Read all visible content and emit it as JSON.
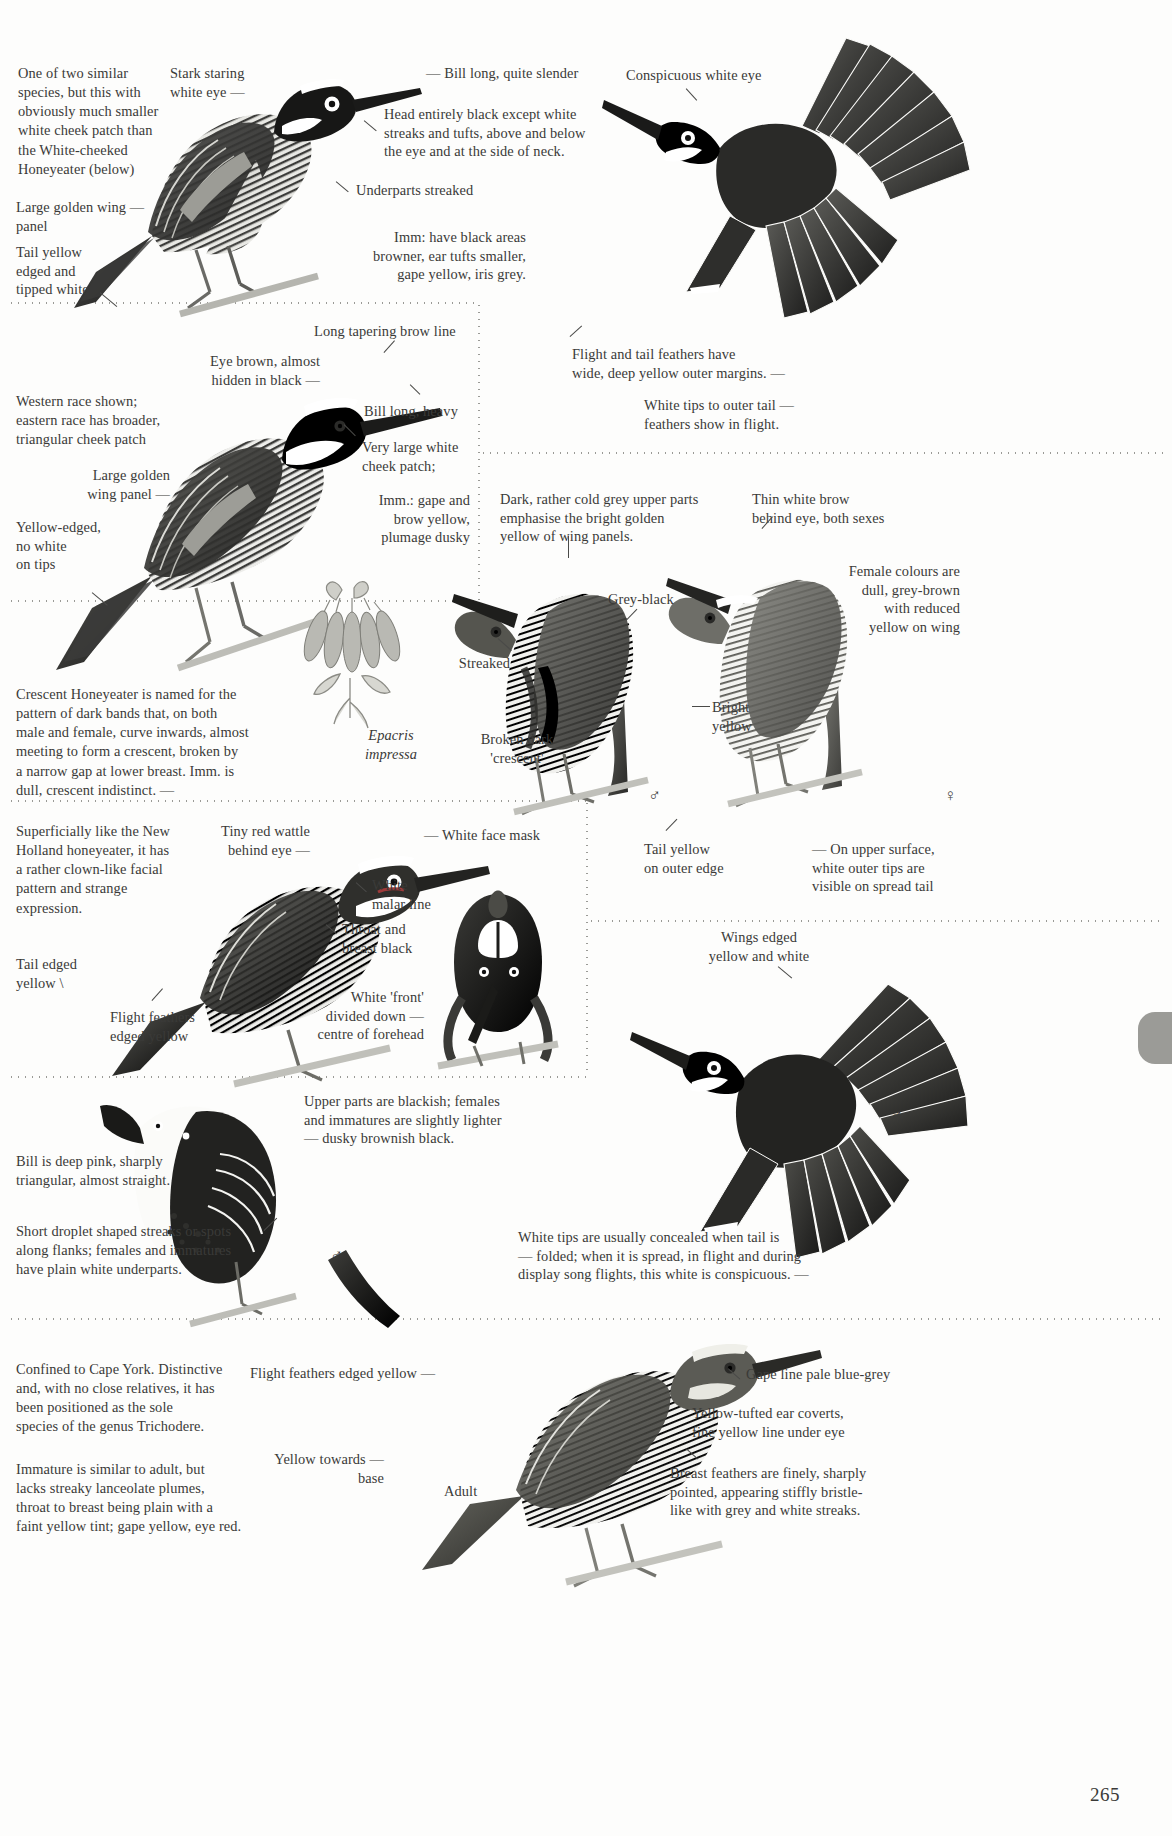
{
  "page": {
    "number": "265"
  },
  "panels": {
    "p1": {
      "intro": "One of two similar\nspecies, but this with\nobviously much smaller\nwhite cheek patch than\nthe White-cheeked\nHoneyeater (below)",
      "labels": {
        "stark_eye": "Stark staring\nwhite eye  —",
        "golden_panel": "Large golden wing  —\npanel",
        "tail": "Tail yellow\nedged and\ntipped white",
        "bill": "—  Bill long, quite slender",
        "head": "Head entirely black except white\nstreaks and tufts, above and below\nthe eye and at the side of neck.",
        "underparts": "Underparts streaked",
        "imm": "Imm: have black areas\nbrowner, ear tufts smaller,\ngape yellow, iris grey.",
        "white_eye": "Conspicuous white eye",
        "flight_feathers": "Flight and tail feathers have\nwide, deep yellow outer margins.  —",
        "white_tips": "White tips to outer tail  —\nfeathers show in flight."
      }
    },
    "p2": {
      "labels": {
        "brow": "Long tapering brow line",
        "eye_brown": "Eye brown, almost\nhidden in black  —",
        "race": "Western race shown;\neastern race has broader,\ntriangular cheek patch",
        "golden_panel": "Large golden\nwing panel  —",
        "yellow_edged": "Yellow-edged,\nno white\non tips",
        "bill": "Bill long, heavy",
        "cheek": "Very large white\ncheek patch;",
        "imm": "Imm.: gape and\nbrow yellow,\nplumage dusky"
      }
    },
    "p3": {
      "crescent_text": "Crescent Honeyeater is named for the\npattern of dark bands that, on both\nmale and female, curve inwards, almost\nmeeting to form a crescent, broken by\na narrow gap at lower breast.  Imm. is\ndull, crescent indistinct.      —",
      "plant": "Epacris\nimpressa",
      "labels": {
        "dark_grey": "Dark, rather cold grey upper parts\nemphasise the bright golden\nyellow of wing panels.",
        "streaked": "Streaked",
        "grey_black": "Grey-black",
        "broken": "Broken dark\n'crescent'",
        "thin_brow": "Thin white brow\nbehind eye, both sexes",
        "female": "Female colours are\ndull, grey-brown\nwith reduced\nyellow on wing",
        "bright_yellow": "Bright\nyellow",
        "tail_yellow": "Tail yellow\non outer edge",
        "upper_surface": "—  On upper surface,\nwhite outer tips are\nvisible on spread tail",
        "male_symbol": "♂",
        "female_symbol": "♀"
      }
    },
    "p4": {
      "intro": "Superficially like the New\nHolland honeyeater, it has\na rather clown-like facial\npattern and strange\nexpression.",
      "labels": {
        "wattle": "Tiny red wattle\nbehind eye  —",
        "face_mask": "—  White face mask",
        "malar": "White\nmalar line",
        "throat": "Throat and\nbreast black",
        "front": "White 'front'\ndivided down  —\ncentre of forehead",
        "tail_edged": "Tail edged\nyellow  \\",
        "flight_feathers": "Flight feathers\nedged yellow",
        "wings_edged": "Wings edged\nyellow and white",
        "male_symbol": "♂"
      }
    },
    "p5": {
      "labels": {
        "upper_parts": "Upper parts are blackish; females\nand immatures are slightly lighter\n—  dusky brownish black.",
        "bill": "Bill is deep pink, sharply\ntriangular, almost straight.",
        "flanks": "Short droplet shaped streaks or spots\nalong flanks; females and immatures\nhave plain white underparts.",
        "white_tips": "White tips are usually concealed when tail is\n—  folded; when it is spread, in flight and during\ndisplay song flights, this white is conspicuous.  —",
        "male_symbol": "♂"
      }
    },
    "p6": {
      "intro": "Confined to Cape York.  Distinctive\nand, with no close relatives, it has\nbeen positioned as the sole\nspecies of the genus Trichodere.",
      "intro2": "Immature is similar to adult, but\nlacks streaky lanceolate plumes,\nthroat to breast being plain with a\nfaint yellow tint; gape yellow, eye red.",
      "labels": {
        "flight_feathers": "Flight feathers edged yellow  —",
        "yellow_base": "Yellow towards  —\nbase",
        "adult": "Adult",
        "gape": "Gape line pale blue-grey",
        "ear_coverts": "Yellow-tufted ear coverts,\nfine yellow line under eye",
        "breast": "Breast feathers are finely, sharply\npointed, appearing stiffly bristle-\nlike with grey and white streaks."
      }
    }
  },
  "colors": {
    "ink": "#3a3a38",
    "dots": "#9a9a96",
    "tab": "#9b9b97",
    "paper": "#fdfdfc"
  }
}
